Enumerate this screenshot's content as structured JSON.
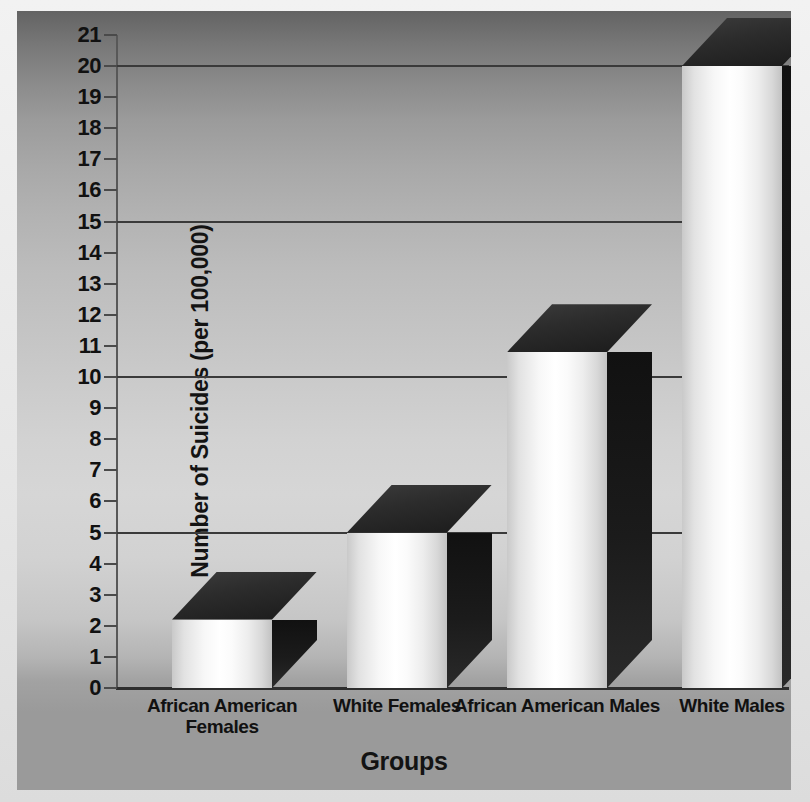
{
  "chart_data": {
    "type": "bar",
    "title": "",
    "xlabel": "Groups",
    "ylabel": "Number of Suicides (per 100,000)",
    "categories": [
      "African American Females",
      "White Females",
      "African American Males",
      "White Males"
    ],
    "values": [
      2.2,
      5,
      10.8,
      20
    ],
    "ylim": [
      0,
      21
    ],
    "ytick_labels": [
      "0",
      "1",
      "2",
      "3",
      "4",
      "5",
      "6",
      "7",
      "8",
      "9",
      "10",
      "11",
      "12",
      "13",
      "14",
      "15",
      "16",
      "17",
      "18",
      "19",
      "20",
      "21"
    ],
    "ytick_values": [
      0,
      1,
      2,
      3,
      4,
      5,
      6,
      7,
      8,
      9,
      10,
      11,
      12,
      13,
      14,
      15,
      16,
      17,
      18,
      19,
      20,
      21
    ],
    "gridline_values": [
      0,
      5,
      10,
      15,
      20
    ],
    "grid": true,
    "legend": "none",
    "style": "3d-bar",
    "colors": {
      "bar_front": "#ffffff",
      "bar_side": "#141414",
      "bar_top": "#2b2b2b",
      "gridline": "#3a3a3a",
      "axis": "#2e2e2e",
      "text": "#111111",
      "panel_top": "#636363",
      "panel_mid": "#d6d6d6",
      "panel_bottom": "#9a9a9a"
    }
  },
  "axis": {
    "x_title": "Groups",
    "y_title": "Number of Suicides (per 100,000)"
  }
}
